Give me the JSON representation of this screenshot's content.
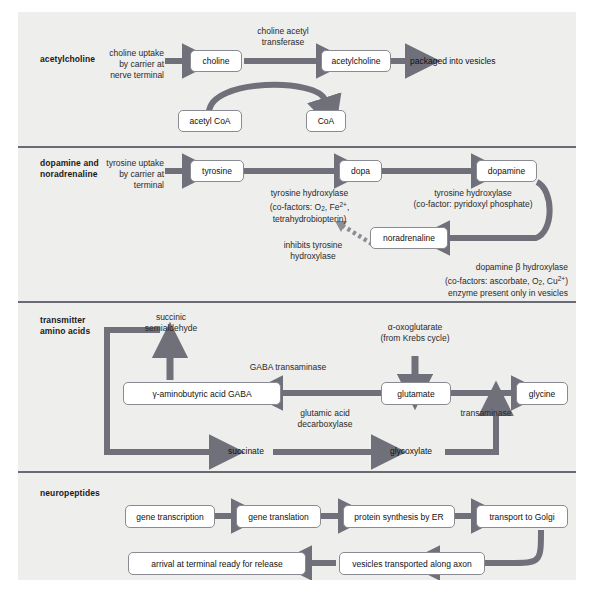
{
  "figure": {
    "accent_arrow_color": "#6f7079",
    "divider_color": "#6a6a72",
    "panel_bg": "#eeeeec",
    "box_border": "#8a8a92"
  },
  "sections": [
    {
      "id": "acetylcholine",
      "label": "acetylcholine",
      "notes": [
        {
          "name": "choline-uptake-note",
          "text_lines": [
            "choline uptake",
            "by carrier at",
            "nerve terminal"
          ]
        },
        {
          "name": "choline-acetyl-transferase-note",
          "text_lines": [
            "choline acetyl",
            "transferase"
          ]
        }
      ],
      "boxes": [
        {
          "name": "choline-box",
          "label": "choline"
        },
        {
          "name": "acetylcholine-box",
          "label": "acetylcholine"
        },
        {
          "name": "acetyl-coa-box",
          "label": "acetyl CoA"
        },
        {
          "name": "coa-box",
          "label": "CoA"
        }
      ],
      "plain_labels": [
        {
          "name": "packaged-into-vesicles-label",
          "label": "packaged into vesicles"
        }
      ]
    },
    {
      "id": "dopamine-noradrenaline",
      "label_lines": [
        "dopamine and",
        "noradrenaline"
      ],
      "notes": [
        {
          "name": "tyrosine-uptake-note",
          "text_lines": [
            "tyrosine uptake",
            "by carrier at",
            "terminal"
          ]
        },
        {
          "name": "tyrosine-hydroxylase-note-1",
          "text_lines": [
            "tyrosine hydroxylase",
            "(co-factors: O2, Fe2+,",
            "tetrahydrobiopterin)"
          ]
        },
        {
          "name": "tyrosine-hydroxylase-note-2",
          "text_lines": [
            "tyrosine hydroxylase",
            "(co-factor: pyridoxyl phosphate)"
          ]
        },
        {
          "name": "inhibits-tyrosine-hydroxylase-note",
          "text_lines": [
            "inhibits tyrosine",
            "hydroxylase"
          ]
        },
        {
          "name": "dopamine-beta-hydroxylase-note",
          "text_lines": [
            "dopamine β hydroxylase",
            "(co-factors: ascorbate, O2, Cu2+)",
            "enzyme present only in vesicles"
          ]
        }
      ],
      "boxes": [
        {
          "name": "tyrosine-box",
          "label": "tyrosine"
        },
        {
          "name": "dopa-box",
          "label": "dopa"
        },
        {
          "name": "dopamine-box",
          "label": "dopamine"
        },
        {
          "name": "noradrenaline-box",
          "label": "noradrenaline"
        }
      ]
    },
    {
      "id": "transmitter-amino-acids",
      "label_lines": [
        "transmitter",
        "amino acids"
      ],
      "notes": [
        {
          "name": "succinic-semialdehyde-note",
          "text_lines": [
            "succinic",
            "semialdehyde"
          ]
        },
        {
          "name": "gaba-transaminase-note",
          "text_lines": [
            "GABA transaminase"
          ]
        },
        {
          "name": "alpha-oxoglutarate-note",
          "text_lines": [
            "α-oxoglutarate",
            "(from Krebs cycle)"
          ]
        },
        {
          "name": "glutamic-acid-decarboxylase-note",
          "text_lines": [
            "glutamic acid",
            "decarboxylase"
          ]
        },
        {
          "name": "transaminase-note",
          "text_lines": [
            "transaminase"
          ]
        },
        {
          "name": "succinate-note",
          "text_lines": [
            "succinate"
          ]
        },
        {
          "name": "glycoxylate-note",
          "text_lines": [
            "glycoxylate"
          ]
        }
      ],
      "boxes": [
        {
          "name": "gaba-box",
          "label": "γ-aminobutyric acid GABA"
        },
        {
          "name": "glutamate-box",
          "label": "glutamate"
        },
        {
          "name": "glycine-box",
          "label": "glycine"
        }
      ]
    },
    {
      "id": "neuropeptides",
      "label": "neuropeptides",
      "boxes": [
        {
          "name": "gene-transcription-box",
          "label": "gene transcription"
        },
        {
          "name": "gene-translation-box",
          "label": "gene translation"
        },
        {
          "name": "protein-synthesis-box",
          "label": "protein synthesis by ER"
        },
        {
          "name": "transport-to-golgi-box",
          "label": "transport to Golgi"
        },
        {
          "name": "vesicles-transported-box",
          "label": "vesicles transported along axon"
        },
        {
          "name": "arrival-at-terminal-box",
          "label": "arrival at terminal ready for release"
        }
      ]
    }
  ]
}
